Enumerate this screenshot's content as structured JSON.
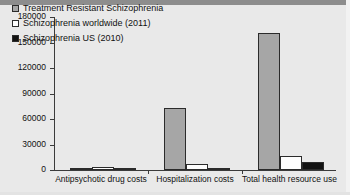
{
  "chart_data": {
    "type": "bar",
    "title": "",
    "xlabel": "",
    "ylabel": "US dollars",
    "ylim": [
      0,
      180000
    ],
    "yticks": [
      0,
      30000,
      60000,
      90000,
      120000,
      150000,
      180000
    ],
    "ytick_labels": [
      "0",
      "30000",
      "60000",
      "90000",
      "120000",
      "150000",
      "180000"
    ],
    "grid": false,
    "legend_position": "upper-left-inside",
    "categories": [
      "Antipsychotic drug costs",
      "Hospitalization costs",
      "Total health resource use"
    ],
    "series": [
      {
        "name": "Treatment Resistant Schizophrenia",
        "color": "#a6a6a6",
        "values": [
          1500,
          73000,
          161000
        ]
      },
      {
        "name": "Schizophrenia worldwide (2011)",
        "color": "#fdfdfd",
        "values": [
          4000,
          7000,
          16000
        ]
      },
      {
        "name": "Schizophrenia US (2010)",
        "color": "#121212",
        "values": [
          1500,
          2000,
          9000
        ]
      }
    ]
  },
  "legend": {
    "items": [
      {
        "label": "Treatment Resistant Schizophrenia",
        "swatch": "gray-square-icon"
      },
      {
        "label": "Schizophrenia worldwide (2011)",
        "swatch": "white-square-icon"
      },
      {
        "label": "Schizophrenia US (2010)",
        "swatch": "black-square-icon"
      }
    ]
  }
}
